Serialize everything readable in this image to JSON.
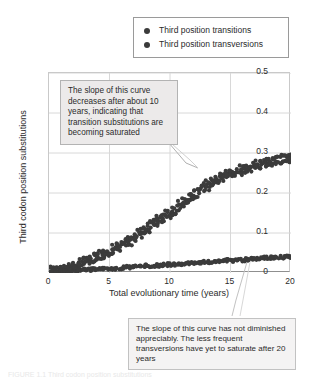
{
  "legend": {
    "position": "top-right",
    "items": [
      {
        "label": "Third position transitions",
        "marker": "filled-circle",
        "color": "#3b3b3b"
      },
      {
        "label": "Third position transversions",
        "marker": "filled-circle",
        "color": "#3b3b3b"
      }
    ]
  },
  "annotations": [
    {
      "id": "transitions-note",
      "text": "The slope of this curve decreases after about 10 years, indicating that transition substitutions are becoming saturated"
    },
    {
      "id": "transversions-note",
      "text": "The slope of this curve has not diminished appreciably. The less frequent transversions have yet to saturate after 20 years"
    }
  ],
  "caption": "FIGURE 1.1  Third codon position substitutions",
  "colors": {
    "marker": "#3b3b3b",
    "grid": "#d8d8d8",
    "axis": "#8f8f8f",
    "annotation_fill": "#eceaea",
    "annotation_border": "#b3b3b3"
  },
  "chart_data": {
    "type": "scatter",
    "title": "",
    "xlabel": "Total evolutionary time (years)",
    "ylabel": "Third codon position substitutions",
    "xlim": [
      0,
      20
    ],
    "ylim": [
      0,
      0.5
    ],
    "xticks": [
      0,
      5,
      10,
      15,
      20
    ],
    "yticks": [
      0,
      0.1,
      0.2,
      0.3,
      0.4,
      0.5
    ],
    "ytick_labels": [
      "0",
      "0.1",
      "0.2",
      "0.3",
      "0.4",
      "0.5"
    ],
    "xtick_labels": [
      "0",
      "5",
      "10",
      "15",
      "20"
    ],
    "grid": true,
    "legend_position": "top-right",
    "series": [
      {
        "name": "Third position transitions",
        "color": "#3b3b3b",
        "points": [
          [
            0.1,
            0.002
          ],
          [
            0.25,
            0.004
          ],
          [
            0.4,
            0.003
          ],
          [
            0.55,
            0.006
          ],
          [
            0.7,
            0.005
          ],
          [
            0.85,
            0.008
          ],
          [
            1.0,
            0.009
          ],
          [
            1.15,
            0.011
          ],
          [
            1.3,
            0.01
          ],
          [
            1.45,
            0.013
          ],
          [
            1.6,
            0.015
          ],
          [
            1.75,
            0.014
          ],
          [
            1.9,
            0.017
          ],
          [
            2.05,
            0.019
          ],
          [
            2.2,
            0.018
          ],
          [
            2.35,
            0.022
          ],
          [
            2.5,
            0.024
          ],
          [
            2.65,
            0.023
          ],
          [
            2.8,
            0.027
          ],
          [
            2.95,
            0.029
          ],
          [
            3.1,
            0.028
          ],
          [
            3.25,
            0.032
          ],
          [
            3.4,
            0.034
          ],
          [
            3.55,
            0.033
          ],
          [
            3.7,
            0.038
          ],
          [
            3.85,
            0.04
          ],
          [
            4.0,
            0.039
          ],
          [
            4.15,
            0.044
          ],
          [
            4.3,
            0.046
          ],
          [
            4.45,
            0.045
          ],
          [
            4.6,
            0.05
          ],
          [
            4.75,
            0.053
          ],
          [
            4.9,
            0.052
          ],
          [
            5.05,
            0.057
          ],
          [
            5.2,
            0.06
          ],
          [
            5.35,
            0.059
          ],
          [
            5.5,
            0.064
          ],
          [
            5.65,
            0.067
          ],
          [
            5.8,
            0.066
          ],
          [
            5.95,
            0.071
          ],
          [
            6.1,
            0.074
          ],
          [
            6.25,
            0.073
          ],
          [
            6.4,
            0.079
          ],
          [
            6.55,
            0.082
          ],
          [
            6.7,
            0.081
          ],
          [
            6.85,
            0.087
          ],
          [
            7.0,
            0.09
          ],
          [
            7.15,
            0.089
          ],
          [
            7.3,
            0.096
          ],
          [
            7.45,
            0.1
          ],
          [
            7.6,
            0.098
          ],
          [
            7.75,
            0.105
          ],
          [
            7.9,
            0.11
          ],
          [
            8.05,
            0.113
          ],
          [
            8.2,
            0.111
          ],
          [
            8.35,
            0.118
          ],
          [
            8.5,
            0.122
          ],
          [
            8.65,
            0.12
          ],
          [
            8.8,
            0.127
          ],
          [
            8.95,
            0.131
          ],
          [
            9.1,
            0.129
          ],
          [
            9.25,
            0.136
          ],
          [
            9.4,
            0.14
          ],
          [
            9.55,
            0.138
          ],
          [
            9.7,
            0.145
          ],
          [
            9.85,
            0.15
          ],
          [
            10.0,
            0.148
          ],
          [
            10.15,
            0.155
          ],
          [
            10.3,
            0.16
          ],
          [
            10.45,
            0.158
          ],
          [
            10.6,
            0.165
          ],
          [
            10.75,
            0.17
          ],
          [
            10.9,
            0.168
          ],
          [
            11.05,
            0.175
          ],
          [
            11.2,
            0.18
          ],
          [
            11.35,
            0.178
          ],
          [
            11.5,
            0.185
          ],
          [
            11.65,
            0.19
          ],
          [
            11.8,
            0.188
          ],
          [
            11.95,
            0.196
          ],
          [
            12.1,
            0.2
          ],
          [
            12.25,
            0.198
          ],
          [
            12.4,
            0.205
          ],
          [
            12.55,
            0.21
          ],
          [
            12.7,
            0.208
          ],
          [
            12.85,
            0.215
          ],
          [
            13.0,
            0.22
          ],
          [
            13.15,
            0.218
          ],
          [
            13.3,
            0.224
          ],
          [
            13.45,
            0.228
          ],
          [
            13.6,
            0.226
          ],
          [
            13.75,
            0.231
          ],
          [
            13.9,
            0.235
          ],
          [
            14.05,
            0.233
          ],
          [
            14.2,
            0.238
          ],
          [
            14.35,
            0.242
          ],
          [
            14.5,
            0.24
          ],
          [
            14.65,
            0.245
          ],
          [
            14.8,
            0.248
          ],
          [
            14.95,
            0.246
          ],
          [
            15.1,
            0.25
          ],
          [
            15.25,
            0.253
          ],
          [
            15.4,
            0.251
          ],
          [
            15.55,
            0.255
          ],
          [
            15.7,
            0.258
          ],
          [
            15.85,
            0.256
          ],
          [
            16.0,
            0.26
          ],
          [
            16.15,
            0.263
          ],
          [
            16.3,
            0.261
          ],
          [
            16.45,
            0.264
          ],
          [
            16.6,
            0.267
          ],
          [
            16.75,
            0.265
          ],
          [
            16.9,
            0.268
          ],
          [
            17.05,
            0.271
          ],
          [
            17.2,
            0.269
          ],
          [
            17.35,
            0.272
          ],
          [
            17.5,
            0.274
          ],
          [
            17.65,
            0.272
          ],
          [
            17.8,
            0.275
          ],
          [
            17.95,
            0.277
          ],
          [
            18.1,
            0.276
          ],
          [
            18.25,
            0.278
          ],
          [
            18.4,
            0.28
          ],
          [
            18.55,
            0.278
          ],
          [
            18.7,
            0.281
          ],
          [
            18.85,
            0.283
          ],
          [
            19.0,
            0.281
          ],
          [
            19.15,
            0.284
          ],
          [
            19.3,
            0.285
          ],
          [
            19.45,
            0.284
          ],
          [
            19.6,
            0.286
          ],
          [
            19.75,
            0.287
          ],
          [
            19.9,
            0.286
          ],
          [
            20.0,
            0.288
          ]
        ],
        "scatter_jitter_y": 0.012,
        "description": "Saturating curve: rises steeply then flattens, reaching about 0.28 at 20 years"
      },
      {
        "name": "Third position transversions",
        "color": "#3b3b3b",
        "points": [
          [
            0.1,
            0.001
          ],
          [
            0.35,
            0.002
          ],
          [
            0.6,
            0.002
          ],
          [
            0.85,
            0.003
          ],
          [
            1.1,
            0.003
          ],
          [
            1.35,
            0.004
          ],
          [
            1.6,
            0.004
          ],
          [
            1.85,
            0.005
          ],
          [
            2.1,
            0.005
          ],
          [
            2.35,
            0.006
          ],
          [
            2.6,
            0.006
          ],
          [
            2.85,
            0.007
          ],
          [
            3.1,
            0.007
          ],
          [
            3.35,
            0.008
          ],
          [
            3.6,
            0.008
          ],
          [
            3.85,
            0.009
          ],
          [
            4.1,
            0.009
          ],
          [
            4.35,
            0.01
          ],
          [
            4.6,
            0.01
          ],
          [
            4.85,
            0.011
          ],
          [
            5.1,
            0.011
          ],
          [
            5.35,
            0.012
          ],
          [
            5.6,
            0.012
          ],
          [
            5.85,
            0.013
          ],
          [
            6.1,
            0.013
          ],
          [
            6.35,
            0.014
          ],
          [
            6.6,
            0.014
          ],
          [
            6.85,
            0.015
          ],
          [
            7.1,
            0.015
          ],
          [
            7.35,
            0.016
          ],
          [
            7.6,
            0.016
          ],
          [
            7.85,
            0.017
          ],
          [
            8.1,
            0.017
          ],
          [
            8.35,
            0.018
          ],
          [
            8.6,
            0.018
          ],
          [
            8.85,
            0.019
          ],
          [
            9.1,
            0.019
          ],
          [
            9.35,
            0.02
          ],
          [
            9.6,
            0.02
          ],
          [
            9.85,
            0.021
          ],
          [
            10.1,
            0.021
          ],
          [
            10.35,
            0.022
          ],
          [
            10.6,
            0.022
          ],
          [
            10.85,
            0.023
          ],
          [
            11.1,
            0.023
          ],
          [
            11.35,
            0.024
          ],
          [
            11.6,
            0.024
          ],
          [
            11.85,
            0.025
          ],
          [
            12.1,
            0.025
          ],
          [
            12.35,
            0.026
          ],
          [
            12.6,
            0.026
          ],
          [
            12.85,
            0.027
          ],
          [
            13.1,
            0.027
          ],
          [
            13.35,
            0.028
          ],
          [
            13.6,
            0.028
          ],
          [
            13.85,
            0.029
          ],
          [
            14.1,
            0.029
          ],
          [
            14.35,
            0.03
          ],
          [
            14.6,
            0.03
          ],
          [
            14.85,
            0.031
          ],
          [
            15.1,
            0.031
          ],
          [
            15.35,
            0.032
          ],
          [
            15.6,
            0.032
          ],
          [
            15.85,
            0.033
          ],
          [
            16.1,
            0.033
          ],
          [
            16.35,
            0.034
          ],
          [
            16.6,
            0.034
          ],
          [
            16.85,
            0.035
          ],
          [
            17.1,
            0.035
          ],
          [
            17.35,
            0.036
          ],
          [
            17.6,
            0.036
          ],
          [
            17.85,
            0.037
          ],
          [
            18.1,
            0.037
          ],
          [
            18.35,
            0.038
          ],
          [
            18.6,
            0.038
          ],
          [
            18.85,
            0.039
          ],
          [
            19.1,
            0.039
          ],
          [
            19.35,
            0.04
          ],
          [
            19.6,
            0.04
          ],
          [
            19.85,
            0.041
          ],
          [
            20.0,
            0.041
          ]
        ],
        "scatter_jitter_y": 0.004,
        "description": "Nearly linear curve rising slowly to about 0.04 at 20 years"
      }
    ]
  }
}
